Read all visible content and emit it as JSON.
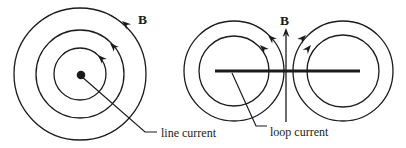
{
  "figure": {
    "ink_color": "#1b1b1b",
    "background_color": "#ffffff",
    "line_current_diagram": {
      "field_label": "B",
      "caption": "line current",
      "description": "three concentric counterclockwise magnetic field circles around a wire cross-section dot"
    },
    "loop_current_diagram": {
      "field_label": "B",
      "caption": "loop current",
      "description": "two pairs of concentric field circles around the edge-on loop bar with upward axial field arrow"
    }
  }
}
